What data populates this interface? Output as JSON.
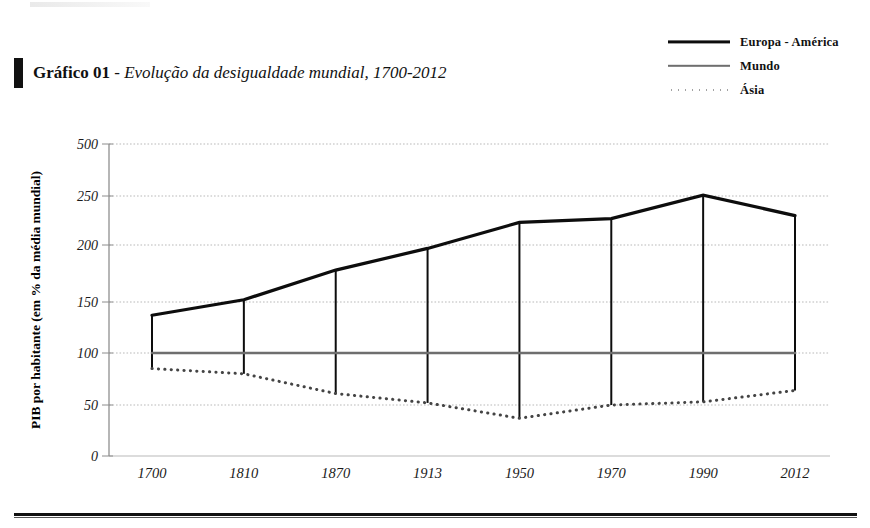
{
  "page": {
    "title_prefix": "Gráfico 01",
    "title_separator": " - ",
    "title_main": "Evolução da desigualdade mundial, 1700-2012"
  },
  "legend": {
    "items": [
      {
        "label": "Europa - América",
        "style": "thick-solid",
        "color": "#0d0d0d",
        "icon": "line-solid-thick-icon"
      },
      {
        "label": "Mundo",
        "style": "thin-solid",
        "color": "#6e6e6e",
        "icon": "line-solid-thin-icon"
      },
      {
        "label": "Ásia",
        "style": "dotted",
        "color": "#444444",
        "icon": "line-dotted-icon"
      }
    ]
  },
  "chart_data": {
    "type": "line",
    "title": "Gráfico 01 - Evolução da desigualdade mundial, 1700-2012",
    "xlabel": "",
    "ylabel": "PIB por habitante (em % da média mundial)",
    "categories": [
      "1700",
      "1810",
      "1870",
      "1913",
      "1950",
      "1970",
      "1990",
      "2012"
    ],
    "yticks": [
      0,
      50,
      100,
      150,
      200,
      250,
      500
    ],
    "ytick_labels": [
      "0",
      "50",
      "100",
      "150",
      "200",
      "250",
      "500"
    ],
    "ylim": [
      0,
      500
    ],
    "y_axis_note": "broken/compressed scale above 250",
    "grid": true,
    "legend_position": "top-right",
    "series": [
      {
        "name": "Europa - América",
        "color": "#0d0d0d",
        "style": "solid",
        "values": [
          137,
          152,
          178,
          197,
          223,
          227,
          254,
          230
        ]
      },
      {
        "name": "Mundo",
        "color": "#6e6e6e",
        "style": "solid",
        "values": [
          100,
          100,
          100,
          100,
          100,
          100,
          100,
          100
        ]
      },
      {
        "name": "Ásia",
        "color": "#444444",
        "style": "dotted",
        "values": [
          85,
          80,
          61,
          52,
          37,
          50,
          53,
          64
        ]
      }
    ],
    "connectors": {
      "description": "vertical drop lines joining Europa-América to Ásia at each category",
      "visible": true
    }
  }
}
